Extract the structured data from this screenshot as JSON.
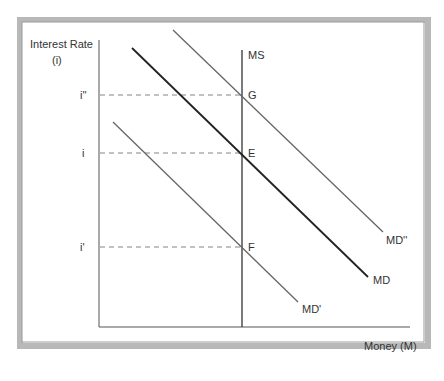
{
  "diagram": {
    "y_axis_label_line1": "Interest Rate",
    "y_axis_label_line2": "(i)",
    "x_axis_label": "Money (M)",
    "rate_labels": {
      "high": "i''",
      "mid": "i",
      "low": "i'"
    },
    "point_labels": {
      "G": "G",
      "E": "E",
      "F": "F"
    },
    "supply_label": "MS",
    "curve_labels": {
      "md": "MD",
      "md_low": "MD'",
      "md_high": "MD''"
    }
  }
}
